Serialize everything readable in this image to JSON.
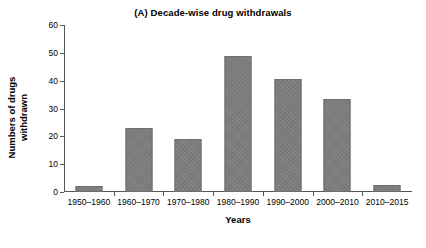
{
  "chart_data": {
    "type": "bar",
    "title": "(A) Decade-wise drug withdrawals",
    "xlabel": "Years",
    "ylabel": "Numbers of drugs withdrawn",
    "ylabel_line1": "Numbers of drugs",
    "ylabel_line2": "withdrawn",
    "categories": [
      "1950–1960",
      "1960–1970",
      "1970–1980",
      "1980–1990",
      "1990–2000",
      "2000–2010",
      "2010–2015"
    ],
    "values": [
      2,
      23,
      19,
      49,
      40.5,
      33.5,
      2.5
    ],
    "ylim": [
      0,
      60
    ],
    "yticks": [
      0,
      10,
      20,
      30,
      40,
      50,
      60
    ],
    "ytick_labels": [
      "0",
      "10",
      "20",
      "30",
      "40",
      "50",
      "60"
    ],
    "grid": false,
    "legend": null,
    "bar_color": "#7c7c7c",
    "axis_color": "#555555",
    "text_color": "#000000"
  }
}
